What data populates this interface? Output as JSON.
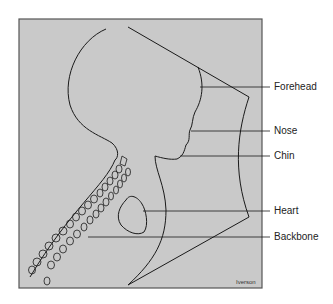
{
  "diagram": {
    "labels": [
      {
        "id": "forehead",
        "text": "Forehead",
        "y": 87
      },
      {
        "id": "nose",
        "text": "Nose",
        "y": 131
      },
      {
        "id": "chin",
        "text": "Chin",
        "y": 156
      },
      {
        "id": "heart",
        "text": "Heart",
        "y": 211
      },
      {
        "id": "backbone",
        "text": "Backbone",
        "y": 237
      }
    ],
    "credit": "Iverson",
    "colors": {
      "background": "#c9c9c9",
      "frame": "#555555",
      "line": "#1a1a1a"
    }
  }
}
